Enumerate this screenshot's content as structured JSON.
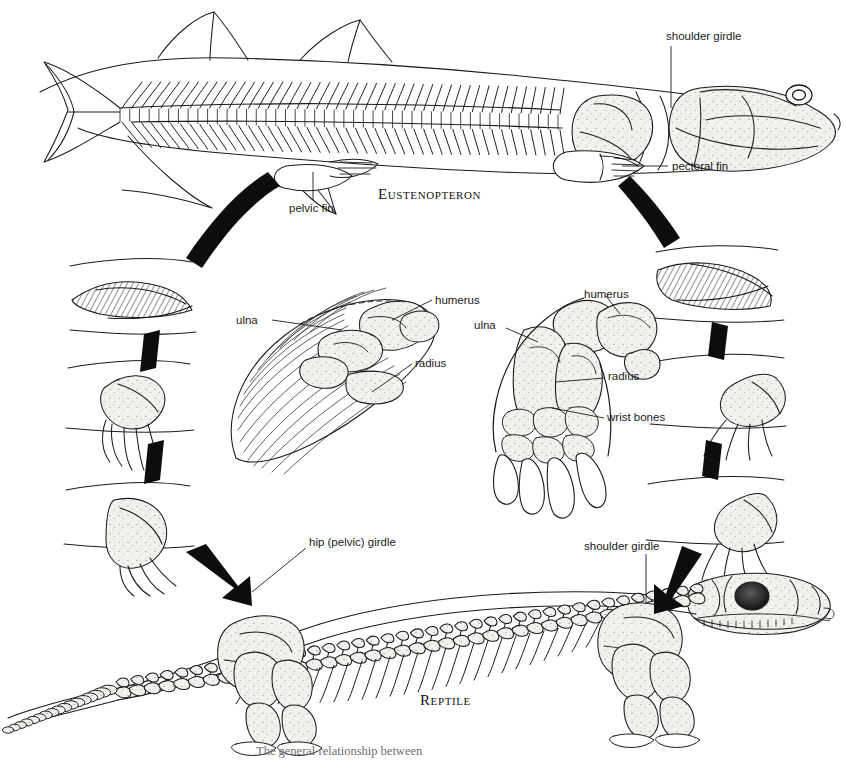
{
  "figure": {
    "background": "#ffffff",
    "ink": "#111111",
    "caption": "The general relationship between"
  },
  "taxa": {
    "top": "Eustenopteron",
    "bottom": "Reptile"
  },
  "labels": {
    "shoulder_girdle_top": "shoulder girdle",
    "pectoral_fin": "pectoral fin",
    "pelvic_fin": "pelvic fin",
    "humerus_left": "humerus",
    "ulna_left": "ulna",
    "radius_left": "radius",
    "humerus_right": "humerus",
    "ulna_right": "ulna",
    "radius_right": "radius",
    "wrist_bones": "wrist bones",
    "hip_girdle": "hip (pelvic) girdle",
    "shoulder_girdle_bottom": "shoulder girdle"
  },
  "panels": {
    "left_sequence": [
      "fin-stage-1",
      "fin-stage-2",
      "fin-stage-3"
    ],
    "right_sequence": [
      "fin-stage-1",
      "fin-stage-2",
      "fin-stage-3"
    ],
    "center_left": "pectoral-fin-skeleton-detail",
    "center_right": "forelimb-skeleton-detail"
  },
  "connectors": {
    "curved_band_left": "curved-arrow-band",
    "curved_band_right": "curved-arrow-band",
    "short_bands": 4,
    "bold_arrow_left": "bold-arrow",
    "bold_arrow_right": "bold-arrow"
  }
}
